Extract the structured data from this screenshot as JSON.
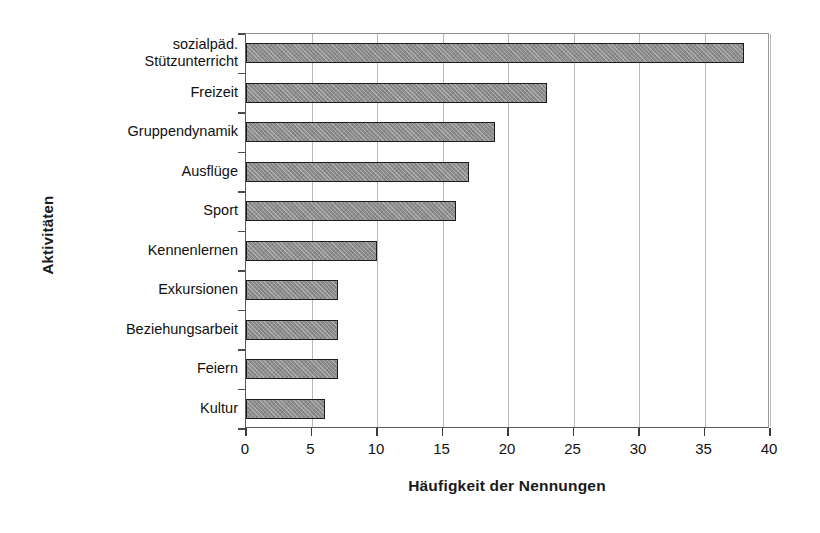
{
  "chart_data": {
    "type": "bar",
    "orientation": "horizontal",
    "title": "",
    "xlabel": "Häufigkeit der Nennungen",
    "ylabel": "Aktivitäten",
    "xlim": [
      0,
      40
    ],
    "xticks": [
      "0",
      "5",
      "10",
      "15",
      "20",
      "25",
      "30",
      "35",
      "40"
    ],
    "xtick_step": 5,
    "grid": "vertical",
    "legend": "none",
    "bar_fill_color": "#8d8d8d",
    "bar_border_color": "#1c1c1c",
    "gridline_color": "#b9b9b9",
    "categories": [
      "sozialpäd.\nStützunterricht",
      "Freizeit",
      "Gruppendynamik",
      "Ausflüge",
      "Sport",
      "Kennenlernen",
      "Exkursionen",
      "Beziehungsarbeit",
      "Feiern",
      "Kultur"
    ],
    "values": [
      38,
      23,
      19,
      17,
      16,
      10,
      7,
      7,
      7,
      6
    ]
  }
}
